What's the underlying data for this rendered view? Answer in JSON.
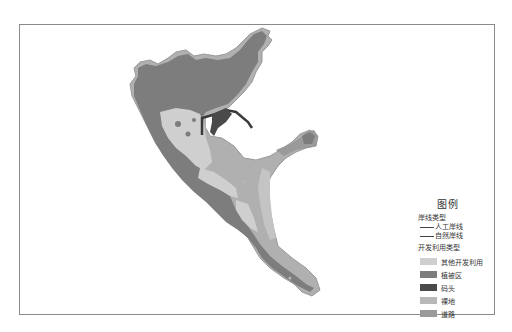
{
  "legend": {
    "title": "图例",
    "coastline_heading": "岸线类型",
    "coastline_types": [
      {
        "label": "人工岸线",
        "color": "#444444"
      },
      {
        "label": "自然岸线",
        "color": "#444444"
      }
    ],
    "landuse_heading": "开发利用类型",
    "landuse_types": [
      {
        "label": "其他开发利用",
        "color": "#cfcfcf"
      },
      {
        "label": "植被区",
        "color": "#7d7d7d"
      },
      {
        "label": "码头",
        "color": "#4a4a4a"
      },
      {
        "label": "裸地",
        "color": "#b8b8b8"
      },
      {
        "label": "道路",
        "color": "#9a9a9a"
      }
    ]
  },
  "colors": {
    "vegetation": "#7d7d7d",
    "other_use": "#cfcfcf",
    "bare_land": "#b8b8b8",
    "road_edge": "#a0a0a0",
    "wharf": "#4a4a4a",
    "frame": "#8a8a8a"
  }
}
